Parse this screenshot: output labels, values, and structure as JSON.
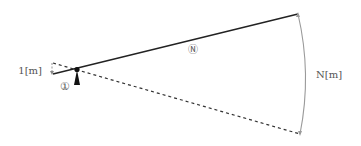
{
  "diagram": {
    "labels": {
      "short_side_length": "1[m]",
      "long_side_length": "N[m]",
      "short_marker": "①",
      "long_marker": "Ⓝ"
    },
    "colors": {
      "line": "#222222",
      "dashed": "#333333",
      "arc": "#9a9a9a",
      "text": "#555555",
      "fulcrum": "#111111"
    }
  }
}
